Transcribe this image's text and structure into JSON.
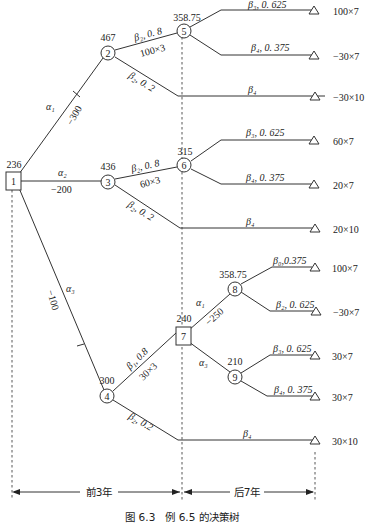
{
  "caption": "图 6.3　例 6.5 的决策树",
  "timeline": {
    "left_label": "前3年",
    "right_label": "后7年"
  },
  "nodes": {
    "n1": {
      "id": "1",
      "type": "decision",
      "value": "236"
    },
    "n2": {
      "id": "2",
      "type": "chance",
      "value": "467"
    },
    "n3": {
      "id": "3",
      "type": "chance",
      "value": "436"
    },
    "n4": {
      "id": "4",
      "type": "chance",
      "value": "300"
    },
    "n5": {
      "id": "5",
      "type": "chance",
      "value": "358.75"
    },
    "n6": {
      "id": "6",
      "type": "chance",
      "value": "315"
    },
    "n7": {
      "id": "7",
      "type": "decision",
      "value": "240"
    },
    "n8": {
      "id": "8",
      "type": "chance",
      "value": "358.75"
    },
    "n9": {
      "id": "9",
      "type": "chance",
      "value": "210"
    }
  },
  "edges": {
    "a1": {
      "label": "α₁",
      "cost": "−300"
    },
    "a2": {
      "label": "α₂",
      "cost": "−200"
    },
    "a3": {
      "label": "α₃",
      "cost": "−100"
    },
    "n2_up": {
      "label": "β₂, 0. 8",
      "sub": "100×3"
    },
    "n2_down": {
      "label": "β₂, 0. 2"
    },
    "n3_up": {
      "label": "β₂, 0. 8",
      "sub": "60×3"
    },
    "n3_down": {
      "label": "β₂, 0. 2"
    },
    "n4_up": {
      "label": "β₁, 0.8",
      "sub": "30×3"
    },
    "n4_down": {
      "label": "β₂, 0.2"
    },
    "n5_up": {
      "label": "β₃, 0. 625"
    },
    "n5_down": {
      "label": "β₄, 0. 375"
    },
    "n2_long": {
      "label": "β₄"
    },
    "n6_up": {
      "label": "β₃, 0. 625"
    },
    "n6_down": {
      "label": "β₄, 0. 375"
    },
    "n3_long": {
      "label": "β₄"
    },
    "n7_a1": {
      "label": "α₁",
      "cost": "−250"
    },
    "n7_a3": {
      "label": "α₃"
    },
    "n8_up": {
      "label": "β₀,0.375"
    },
    "n8_down": {
      "label": "β₂, 0. 625"
    },
    "n9_up": {
      "label": "β₃, 0. 625"
    },
    "n9_down": {
      "label": "β₄, 0. 375"
    },
    "n4_long": {
      "label": "β₄"
    }
  },
  "payoffs": [
    "100×7",
    "−30×7",
    "−30×10",
    "60×7",
    "20×7",
    "20×10",
    "100×7",
    "−30×7",
    "30×7",
    "30×7",
    "30×10"
  ]
}
